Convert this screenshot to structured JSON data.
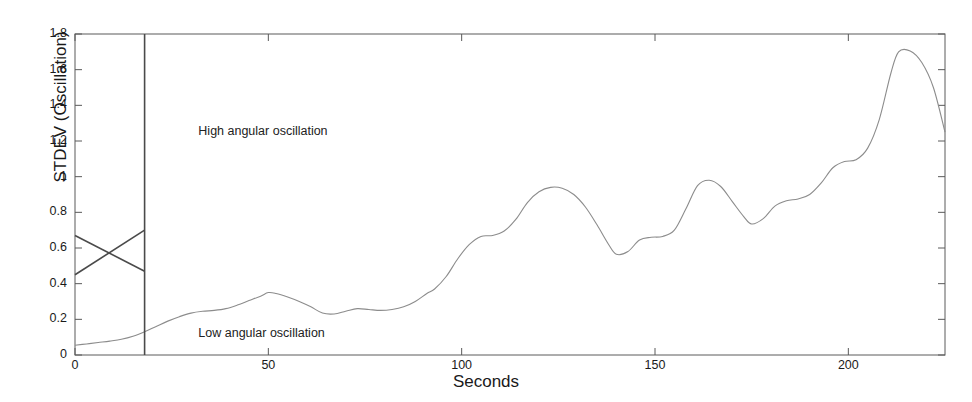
{
  "chart_data": {
    "type": "line",
    "title": "",
    "xlabel": "Seconds",
    "ylabel": "STDEV (Oscillation)",
    "xlim": [
      0,
      225
    ],
    "ylim": [
      0,
      1.8
    ],
    "xticks": [
      0,
      50,
      100,
      150,
      200
    ],
    "xtick_labels": [
      "0",
      "50",
      "100",
      "150",
      "200"
    ],
    "yticks": [
      0,
      0.2,
      0.4,
      0.6,
      0.8,
      1,
      1.2,
      1.4,
      1.6,
      1.8
    ],
    "ytick_labels": [
      "0",
      "0.2",
      "0.4",
      "0.6",
      "0.8",
      "1",
      "1.2",
      "1.4",
      "1.6",
      "1.8"
    ],
    "grid": false,
    "legend": "none",
    "line_color": "#8c8c8c",
    "annotations": [
      {
        "text": "High angular oscillation",
        "x": 50,
        "y": 1.25
      },
      {
        "text": "Low angular oscillation",
        "x": 50,
        "y": 0.12
      }
    ],
    "markers": {
      "divider_x": 18,
      "divider_label": "threshold-divider",
      "cross_lines": [
        {
          "name": "descending",
          "x": [
            0,
            18
          ],
          "y": [
            0.67,
            0.47
          ]
        },
        {
          "name": "ascending",
          "x": [
            0,
            18
          ],
          "y": [
            0.45,
            0.7
          ]
        }
      ]
    },
    "series": [
      {
        "name": "STDEV (Oscillation)",
        "x": [
          0,
          3,
          6,
          9,
          12,
          15,
          18,
          21,
          24,
          27,
          30,
          33,
          36,
          39,
          42,
          45,
          48,
          50,
          52,
          55,
          58,
          61,
          64,
          67,
          70,
          73,
          76,
          79,
          82,
          85,
          88,
          91,
          93,
          96,
          99,
          102,
          105,
          108,
          111,
          114,
          117,
          120,
          123,
          126,
          129,
          132,
          135,
          138,
          140,
          143,
          146,
          149,
          152,
          155,
          158,
          161,
          164,
          167,
          170,
          173,
          175,
          178,
          181,
          184,
          187,
          190,
          193,
          196,
          199,
          202,
          205,
          208,
          211,
          213,
          216,
          219,
          222,
          225
        ],
        "y": [
          0.055,
          0.062,
          0.07,
          0.078,
          0.088,
          0.105,
          0.13,
          0.16,
          0.19,
          0.215,
          0.235,
          0.245,
          0.25,
          0.26,
          0.28,
          0.305,
          0.33,
          0.35,
          0.345,
          0.325,
          0.3,
          0.27,
          0.235,
          0.23,
          0.245,
          0.26,
          0.255,
          0.25,
          0.255,
          0.27,
          0.3,
          0.345,
          0.37,
          0.44,
          0.54,
          0.62,
          0.665,
          0.67,
          0.695,
          0.76,
          0.855,
          0.915,
          0.94,
          0.935,
          0.9,
          0.83,
          0.73,
          0.62,
          0.565,
          0.58,
          0.645,
          0.66,
          0.665,
          0.7,
          0.82,
          0.95,
          0.98,
          0.945,
          0.86,
          0.775,
          0.735,
          0.765,
          0.835,
          0.865,
          0.875,
          0.9,
          0.965,
          1.05,
          1.085,
          1.095,
          1.16,
          1.32,
          1.58,
          1.7,
          1.705,
          1.64,
          1.5,
          1.25
        ]
      }
    ]
  }
}
